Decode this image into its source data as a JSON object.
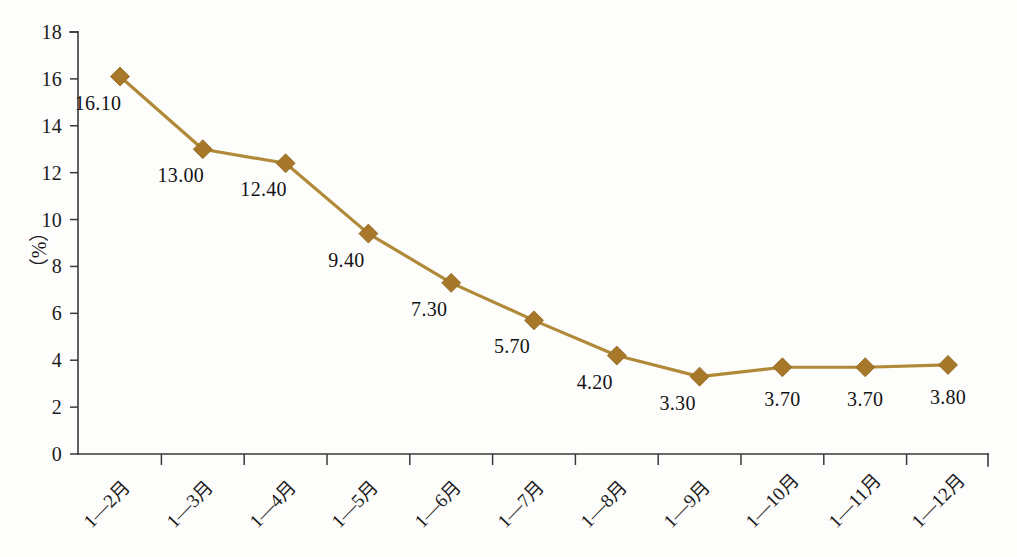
{
  "chart_data": {
    "type": "line",
    "title": "",
    "xlabel": "",
    "ylabel": "（%）",
    "ylim": [
      0,
      18
    ],
    "ytick_step": 2,
    "yticks": [
      "0",
      "2",
      "4",
      "6",
      "8",
      "10",
      "12",
      "14",
      "16",
      "18"
    ],
    "grid": false,
    "legend": "none",
    "categories": [
      "1—2月",
      "1—3月",
      "1—4月",
      "1—5月",
      "1—6月",
      "1—7月",
      "1—8月",
      "1—9月",
      "1—10月",
      "1—11月",
      "1—12月"
    ],
    "values": [
      16.1,
      13.0,
      12.4,
      9.4,
      7.3,
      5.7,
      4.2,
      3.3,
      3.7,
      3.7,
      3.8
    ],
    "point_labels": [
      "16.10",
      "13.00",
      "12.40",
      "9.40",
      "7.30",
      "5.70",
      "4.20",
      "3.30",
      "3.70",
      "3.70",
      "3.80"
    ],
    "series": [
      {
        "name": "",
        "values": [
          16.1,
          13.0,
          12.4,
          9.4,
          7.3,
          5.7,
          4.2,
          3.3,
          3.7,
          3.7,
          3.8
        ]
      }
    ],
    "colors": {
      "line": "#b08a38",
      "marker_fill": "#a8782a",
      "marker_stroke": "#8f6420",
      "axis": "#3a3a3a",
      "text": "#1b1b1b",
      "background": "#fdfdfc"
    }
  }
}
